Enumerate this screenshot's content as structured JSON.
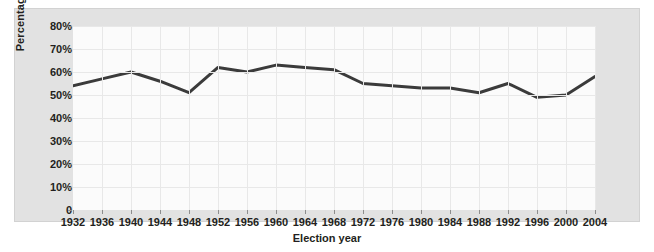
{
  "chart_data": {
    "type": "line",
    "title": "",
    "xlabel": "Election year",
    "ylabel": "Percentage of eligible voters",
    "categories": [
      "1932",
      "1936",
      "1940",
      "1944",
      "1948",
      "1952",
      "1956",
      "1960",
      "1964",
      "1968",
      "1972",
      "1976",
      "1980",
      "1984",
      "1988",
      "1992",
      "1996",
      "2000",
      "2004"
    ],
    "values": [
      54,
      57,
      60,
      56,
      51,
      62,
      60,
      63,
      62,
      61,
      55,
      54,
      53,
      53,
      51,
      55,
      49,
      50,
      58
    ],
    "series": [
      {
        "name": "Voter turnout",
        "values": [
          54,
          57,
          60,
          56,
          51,
          62,
          60,
          63,
          62,
          61,
          55,
          54,
          53,
          53,
          51,
          55,
          49,
          50,
          58
        ]
      }
    ],
    "ylim": [
      0,
      80
    ],
    "ytick_labels": [
      "80%",
      "70%",
      "60%",
      "50%",
      "40%",
      "30%",
      "20%",
      "10%",
      "0"
    ],
    "ytick_values": [
      80,
      70,
      60,
      50,
      40,
      30,
      20,
      10,
      0
    ],
    "grid": true,
    "legend": "none",
    "line_color": "#3b3b3b",
    "plot_background": "#fbfbfb",
    "panel_background": "#e2e2e2",
    "grid_color": "#e8e8e8"
  }
}
